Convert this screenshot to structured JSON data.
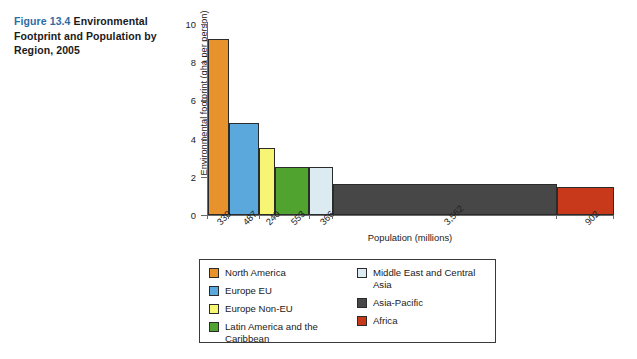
{
  "caption": {
    "figure_number": "Figure 13.4",
    "title": "Environmental Footprint and Population by Region, 2005",
    "number_color": "#2e6ca4"
  },
  "chart_data": {
    "type": "bar",
    "title": "Environmental Footprint and Population by Region, 2005",
    "xlabel": "Population (millions)",
    "ylabel": "Environmental footprint (gha per person)",
    "ylim": [
      0,
      10
    ],
    "yticks": [
      "0",
      "2",
      "4",
      "6",
      "8",
      "10"
    ],
    "grid": false,
    "legend_position": "bottom",
    "note": "Variable-width bar chart: bar width is proportional to population, bar height is environmental footprint.",
    "categories": [
      "North America",
      "Europe EU",
      "Europe Non-EU",
      "Latin America and the Caribbean",
      "Middle East and Central Asia",
      "Asia-Pacific",
      "Africa"
    ],
    "xtick_labels": [
      "330",
      "487",
      "240",
      "553",
      "366",
      "3,562",
      "902"
    ],
    "populations": [
      330,
      487,
      240,
      553,
      366,
      3562,
      902
    ],
    "values": [
      9.2,
      4.8,
      3.5,
      2.5,
      2.5,
      1.6,
      1.45
    ],
    "colors": [
      "#e8922e",
      "#5ba8dc",
      "#f7f574",
      "#4fa32e",
      "#dceaf2",
      "#474747",
      "#c8381a"
    ]
  },
  "legend": {
    "left_column": [
      {
        "label": "North America",
        "color": "#e8922e"
      },
      {
        "label": "Europe EU",
        "color": "#5ba8dc"
      },
      {
        "label": "Europe Non-EU",
        "color": "#f7f574"
      },
      {
        "label": "Latin America and the Caribbean",
        "color": "#4fa32e"
      }
    ],
    "right_column": [
      {
        "label": "Middle East and Central Asia",
        "color": "#dceaf2"
      },
      {
        "label": "Asia-Pacific",
        "color": "#474747"
      },
      {
        "label": "Africa",
        "color": "#c8381a"
      }
    ]
  }
}
